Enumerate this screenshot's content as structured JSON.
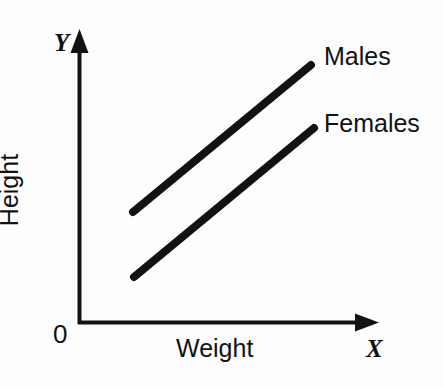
{
  "figure": {
    "background_color": "#fdfdfd",
    "ink_color": "#121212"
  },
  "axes": {
    "y_axis_symbol": "Y",
    "x_axis_symbol": "X",
    "origin_label": "0",
    "y_axis_title": "Height",
    "x_axis_title": "Weight"
  },
  "legend": {
    "males_label": "Males",
    "females_label": "Females"
  },
  "chart_data": {
    "type": "line",
    "title": "",
    "xlabel": "Weight",
    "ylabel": "Height",
    "origin_label": "0",
    "x_axis_symbol": "X",
    "y_axis_symbol": "Y",
    "grid": false,
    "legend_position": "right-of-line-ends",
    "axis_ticks": [],
    "xlim": [
      0,
      1
    ],
    "ylim": [
      0,
      1
    ],
    "annotations": [
      {
        "text": "Males",
        "x_px": 324,
        "y_px": 56
      },
      {
        "text": "Females",
        "x_px": 324,
        "y_px": 123
      }
    ],
    "series": [
      {
        "name": "Males",
        "color": "#121212",
        "line_width_px": 8,
        "points_px": [
          {
            "x": 133,
            "y": 212
          },
          {
            "x": 311,
            "y": 65
          }
        ],
        "x": [
          0.18,
          0.78
        ],
        "values": [
          0.37,
          0.88
        ],
        "description": "Straight positively-sloped line, upper of the two"
      },
      {
        "name": "Females",
        "color": "#121212",
        "line_width_px": 8,
        "points_px": [
          {
            "x": 134,
            "y": 277
          },
          {
            "x": 314,
            "y": 128
          }
        ],
        "x": [
          0.19,
          0.79
        ],
        "values": [
          0.15,
          0.66
        ],
        "description": "Straight positively-sloped line, lower of the two, roughly parallel to Males"
      }
    ]
  }
}
